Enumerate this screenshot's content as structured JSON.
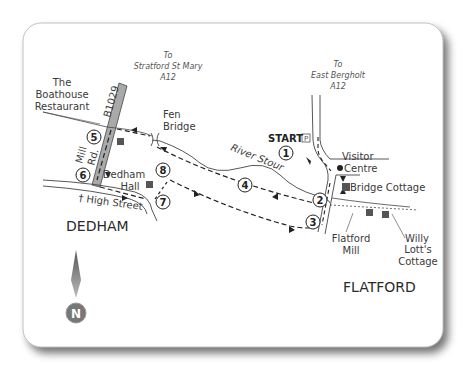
{
  "map": {
    "title": "Dedham to Flatford walk",
    "towns": {
      "dedham": "DEDHAM",
      "flatford": "FLATFORD"
    },
    "road_directions": {
      "stratford": [
        "To",
        "Stratford St Mary",
        "A12"
      ],
      "east_bergholt": [
        "To",
        "East Bergholt",
        "A12"
      ]
    },
    "roads": {
      "b1029": "B1029",
      "mill_rd": [
        "Mill",
        "Rd."
      ],
      "high_street": "High Street"
    },
    "river": "River Stour",
    "places": {
      "boathouse": [
        "The",
        "Boathouse",
        "Restaurant"
      ],
      "fen_bridge": [
        "Fen",
        "Bridge"
      ],
      "dedham_hall": [
        "Dedham",
        "Hall"
      ],
      "visitor_centre": [
        "Visitor",
        "Centre"
      ],
      "bridge_cottage": "Bridge Cottage",
      "flatford_mill": [
        "Flatford",
        "Mill"
      ],
      "willy_lotts": [
        "Willy",
        "Lott's",
        "Cottage"
      ]
    },
    "start_label": "START",
    "parking_icon": "P",
    "waypoints": [
      "1",
      "2",
      "3",
      "4",
      "5",
      "6",
      "7",
      "8"
    ],
    "north": "N",
    "colors": {
      "road_fill": "#a9a9a9",
      "line": "#3a3a3a",
      "waypoint": "#222222"
    }
  }
}
